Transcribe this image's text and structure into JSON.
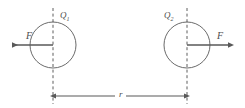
{
  "figure": {
    "type": "physics-diagram",
    "width": 245,
    "height": 108,
    "background_color": "#ffffff",
    "stroke_color": "#595959",
    "text_color": "#4c4c4c"
  },
  "charges": [
    {
      "id": "left",
      "label_base": "Q",
      "label_sub": "1",
      "label_full": "Q1",
      "center_x": 53,
      "center_y": 45,
      "radius": 23,
      "label_x": 60,
      "label_y": 11
    },
    {
      "id": "right",
      "label_base": "Q",
      "label_sub": "2",
      "label_full": "Q2",
      "center_x": 187,
      "center_y": 45,
      "radius": 23,
      "label_x": 164,
      "label_y": 11
    }
  ],
  "forces": [
    {
      "id": "left-force",
      "label": "F",
      "direction": "left",
      "label_x": 26,
      "label_y": 32,
      "tail_x": 53,
      "tip_x": 9,
      "y": 45
    },
    {
      "id": "right-force",
      "label": "F",
      "direction": "right",
      "label_x": 218,
      "label_y": 32,
      "tail_x": 187,
      "tip_x": 231,
      "y": 45
    }
  ],
  "dimension": {
    "label": "r",
    "label_x": 118,
    "label_y": 90,
    "line_y": 96,
    "start_x": 53,
    "end_x": 187,
    "description": "separation distance between the two charge centers"
  },
  "center_lines": [
    {
      "id": "left-center-line",
      "x": 53,
      "y_top": 8,
      "y_bottom": 104,
      "style": "dashed"
    },
    {
      "id": "right-center-line",
      "x": 187,
      "y_top": 8,
      "y_bottom": 104,
      "style": "dashed"
    }
  ]
}
